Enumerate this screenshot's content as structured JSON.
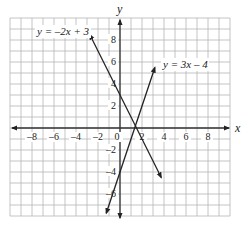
{
  "chart_data": {
    "type": "line",
    "title": "",
    "xlabel": "x",
    "ylabel": "y",
    "xlim": [
      -10,
      10
    ],
    "ylim": [
      -8,
      10
    ],
    "grid": true,
    "grid_step": 1,
    "x_ticks": [
      -8,
      -6,
      -4,
      -2,
      0,
      2,
      4,
      6,
      8
    ],
    "x_tick_labels": [
      "–8",
      "–6",
      "–4",
      "–2",
      "0",
      "2",
      "4",
      "6",
      "8"
    ],
    "y_ticks": [
      8,
      6,
      4,
      2,
      -2,
      -4,
      -6
    ],
    "y_tick_labels": [
      "8",
      "6",
      "4",
      "2",
      "–2",
      "–4",
      "–6"
    ],
    "series": [
      {
        "name": "y = –2x + 3",
        "equation": "y = -2x + 3",
        "slope": -2,
        "intercept": 3,
        "x": [
          -2.75,
          3.75
        ],
        "y": [
          8.5,
          -4.5
        ],
        "color": "#222222",
        "arrows": "both"
      },
      {
        "name": "y = 3x – 4",
        "equation": "y = 3x - 4",
        "slope": 3,
        "intercept": -4,
        "x": [
          -1.25,
          3.17
        ],
        "y": [
          -7.75,
          5.5
        ],
        "color": "#222222",
        "arrows": "both"
      }
    ],
    "annotations": [
      {
        "text": "y = –2x + 3",
        "near": [
          -2.75,
          8.5
        ]
      },
      {
        "text": "y = 3x – 4",
        "near": [
          3.17,
          5.5
        ]
      }
    ],
    "intersection": [
      1.4,
      0.2
    ]
  },
  "colors": {
    "grid": "#b5b5b5",
    "axis": "#333333",
    "line": "#222222",
    "background": "#ffffff"
  }
}
